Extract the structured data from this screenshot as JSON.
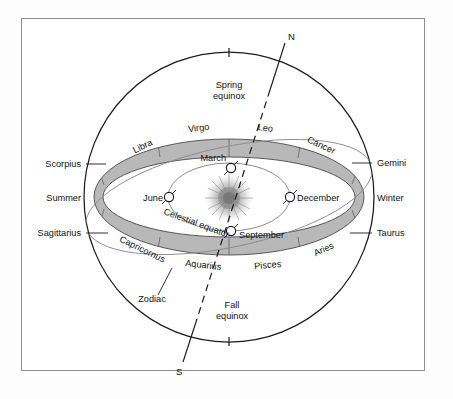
{
  "figure": {
    "background_color": "#ffffff",
    "frame_color": "#8d8d8d",
    "band_fill": "#b8b8b8",
    "line_color": "#1a1a1a",
    "ecliptic_color": "#8a8a8a",
    "sun_color": "#9a9a9a"
  },
  "poles": {
    "north_label": "N",
    "south_label": "S"
  },
  "equinoxes": {
    "spring_line1": "Spring",
    "spring_line2": "equinox",
    "fall_line1": "Fall",
    "fall_line2": "equinox"
  },
  "seasons": {
    "left": "Summer",
    "right": "Winter"
  },
  "annotations": {
    "celestial_equator": "Celestial  equator",
    "zodiac": "Zodiac"
  },
  "zodiac_upper": [
    {
      "name": "Libra"
    },
    {
      "name": "Virgo"
    },
    {
      "name": "Leo"
    },
    {
      "name": "Cancer"
    }
  ],
  "zodiac_lower": [
    {
      "name": "Capricornus"
    },
    {
      "name": "Aquarius"
    },
    {
      "name": "Pisces"
    },
    {
      "name": "Aries"
    }
  ],
  "zodiac_side_left": [
    {
      "name": "Scorpius"
    },
    {
      "name": "Sagittarius"
    }
  ],
  "zodiac_side_right": [
    {
      "name": "Gemini"
    },
    {
      "name": "Taurus"
    }
  ],
  "earth_positions": [
    {
      "month": "March"
    },
    {
      "month": "June"
    },
    {
      "month": "December"
    },
    {
      "month": "September"
    }
  ]
}
